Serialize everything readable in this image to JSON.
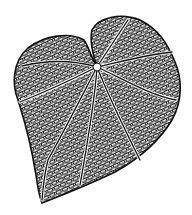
{
  "image": {
    "subject": "Heart-shaped leaf illustration with reticulate venation",
    "style": "black ink line drawing on white",
    "colors": {
      "ink": "#111111",
      "background": "#ffffff"
    },
    "features": [
      "two rounded basal lobes",
      "petiole junction near top center",
      "palmate primary veins radiating from junction",
      "dense net of secondary cells",
      "acute tip pointing lower-left"
    ]
  }
}
